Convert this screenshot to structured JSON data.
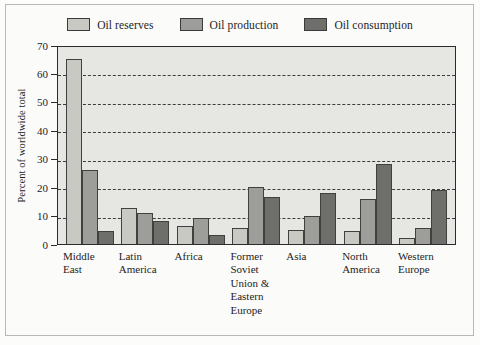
{
  "chart_data": {
    "type": "bar",
    "title": "",
    "subtitle": "",
    "xlabel": "",
    "ylabel": "Percent of worldwide total",
    "ylim": [
      0,
      70
    ],
    "ytick_step": 10,
    "yticks": [
      70,
      60,
      50,
      40,
      30,
      20,
      10,
      0
    ],
    "ytick_labels": [
      "70",
      "60",
      "50",
      "40",
      "30",
      "20",
      "10",
      "0"
    ],
    "grid": "horizontal-dashed",
    "legend_position": "top-center",
    "categories": [
      "Middle East",
      "Latin America",
      "Africa",
      "Former Soviet Union & Eastern Europe",
      "Asia",
      "North America",
      "Western Europe"
    ],
    "category_lines": [
      [
        "Middle",
        "East"
      ],
      [
        "Latin",
        "America"
      ],
      [
        "Africa"
      ],
      [
        "Former",
        "Soviet",
        "Union &",
        "Eastern",
        "Europe"
      ],
      [
        "Asia"
      ],
      [
        "North",
        "America"
      ],
      [
        "Western",
        "Europe"
      ]
    ],
    "series": [
      {
        "name": "Oil reserves",
        "color": "#c9c9c4",
        "values": [
          65,
          12.5,
          6.5,
          5.5,
          5,
          4.5,
          2
        ]
      },
      {
        "name": "Oil production",
        "color": "#9d9d99",
        "values": [
          26,
          11,
          9,
          20,
          10,
          16,
          5.5
        ]
      },
      {
        "name": "Oil consumption",
        "color": "#6e6e6b",
        "values": [
          4.5,
          8,
          3,
          16.5,
          18,
          28,
          19
        ]
      }
    ]
  },
  "colors": {
    "plot_background": "#e6e6e3",
    "page_background": "#fbfbfa",
    "axis": "#2b2b2b",
    "gridline": "#3c3c3c",
    "text": "#1d1d1d",
    "series_1": "#c9c9c4",
    "series_2": "#9d9d99",
    "series_3": "#6e6e6b"
  }
}
